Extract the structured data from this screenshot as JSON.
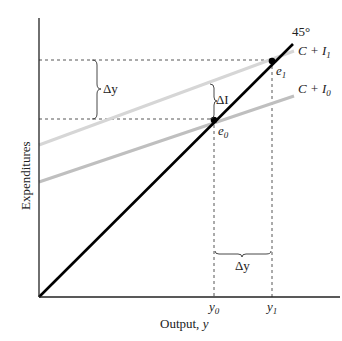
{
  "diagram": {
    "type": "keynesian-cross",
    "axes": {
      "x_label": "Output, ",
      "x_label_var": "y",
      "y_label": "Expenditures"
    },
    "lines": {
      "forty_five": {
        "label": "45°",
        "color": "#000000"
      },
      "c_plus_i1": {
        "label_c": "C + I",
        "label_sub": "1",
        "color": "#d4d4d4"
      },
      "c_plus_i0": {
        "label_c": "C + I",
        "label_sub": "0",
        "color": "#bdbdbd"
      }
    },
    "points": {
      "e0": {
        "label": "e",
        "sub": "0"
      },
      "e1": {
        "label": "e",
        "sub": "1"
      }
    },
    "ticks": {
      "y0": {
        "label": "y",
        "sub": "0"
      },
      "y1": {
        "label": "y",
        "sub": "1"
      }
    },
    "annotations": {
      "delta_y_vertical": "Δy",
      "delta_i": "ΔI",
      "delta_y_horizontal": "Δy"
    }
  }
}
